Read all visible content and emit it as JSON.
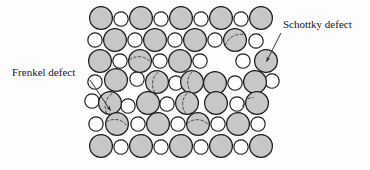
{
  "figure": {
    "background_color": "#fdfdfd",
    "anion": {
      "name": "large-ion",
      "fill": "#c7c7c7",
      "stroke": "#1c1c1c",
      "radius": 11.4
    },
    "cation": {
      "name": "small-ion",
      "fill": "#fefefe",
      "stroke": "#1c1c1c",
      "radius": 7.2
    },
    "defect_marker": {
      "stroke": "#4a4a52",
      "style": "dashed",
      "dash": "2.6,2.2"
    },
    "leader_stroke": "#2a2a30"
  },
  "labels": [
    {
      "id": "schottky",
      "text": "Schottky defect",
      "x": 283,
      "y": 28,
      "anchor": "start",
      "leader": {
        "x1": 281,
        "y1": 33,
        "x2": 266.5,
        "y2": 61.5
      }
    },
    {
      "id": "frenkel",
      "text": "Frenkel defect",
      "x": 12,
      "y": 76,
      "anchor": "start",
      "leader": {
        "x1": 90,
        "y1": 80,
        "x2": 110.5,
        "y2": 110.5
      }
    }
  ],
  "lattice": {
    "rows": 7,
    "description": "Alternating large and small ions; rows offset, with vacancies and displaced ions marking Schottky and Frenkel defects.",
    "atoms": [
      {
        "t": "L",
        "x": 101,
        "y": 18
      },
      {
        "t": "S",
        "x": 121,
        "y": 19
      },
      {
        "t": "L",
        "x": 141,
        "y": 18
      },
      {
        "t": "S",
        "x": 161,
        "y": 19
      },
      {
        "t": "L",
        "x": 181,
        "y": 18
      },
      {
        "t": "S",
        "x": 201,
        "y": 19
      },
      {
        "t": "L",
        "x": 221,
        "y": 18
      },
      {
        "t": "S",
        "x": 241,
        "y": 19
      },
      {
        "t": "L",
        "x": 261,
        "y": 18
      },
      {
        "t": "S",
        "x": 95,
        "y": 40
      },
      {
        "t": "L",
        "x": 115,
        "y": 40
      },
      {
        "t": "S",
        "x": 135,
        "y": 40
      },
      {
        "t": "L",
        "x": 155,
        "y": 40
      },
      {
        "t": "S",
        "x": 175,
        "y": 40
      },
      {
        "t": "L",
        "x": 195,
        "y": 40
      },
      {
        "t": "S",
        "x": 215,
        "y": 40
      },
      {
        "t": "L",
        "x": 235,
        "y": 40,
        "d": "arc"
      },
      {
        "t": "S",
        "x": 256,
        "y": 41
      },
      {
        "t": "L",
        "x": 100,
        "y": 61
      },
      {
        "t": "S",
        "x": 120,
        "y": 61
      },
      {
        "t": "L",
        "x": 140,
        "y": 61,
        "d": "arc"
      },
      {
        "t": "S",
        "x": 160,
        "y": 61
      },
      {
        "t": "L",
        "x": 180,
        "y": 61
      },
      {
        "t": "S",
        "x": 200,
        "y": 61
      },
      {
        "t": "S",
        "x": 243,
        "y": 61
      },
      {
        "t": "L",
        "x": 266,
        "y": 61
      },
      {
        "t": "S",
        "x": 95,
        "y": 82
      },
      {
        "t": "L",
        "x": 116,
        "y": 80
      },
      {
        "t": "S",
        "x": 137,
        "y": 79
      },
      {
        "t": "L",
        "x": 157,
        "y": 82,
        "d": "arc"
      },
      {
        "t": "S",
        "x": 176,
        "y": 83
      },
      {
        "t": "L",
        "x": 192,
        "y": 82,
        "d": "arc"
      },
      {
        "t": "L",
        "x": 215,
        "y": 83
      },
      {
        "t": "S",
        "x": 235,
        "y": 83
      },
      {
        "t": "L",
        "x": 255,
        "y": 82
      },
      {
        "t": "S",
        "x": 272,
        "y": 81
      },
      {
        "t": "S",
        "x": 92,
        "y": 101
      },
      {
        "t": "L",
        "x": 110,
        "y": 103,
        "d": "arc"
      },
      {
        "t": "S",
        "x": 128,
        "y": 106
      },
      {
        "t": "L",
        "x": 148,
        "y": 103
      },
      {
        "t": "S",
        "x": 167,
        "y": 104
      },
      {
        "t": "L",
        "x": 187,
        "y": 103,
        "d": "arc"
      },
      {
        "t": "L",
        "x": 216,
        "y": 103
      },
      {
        "t": "S",
        "x": 237,
        "y": 104
      },
      {
        "t": "L",
        "x": 257,
        "y": 103
      },
      {
        "t": "S",
        "x": 96,
        "y": 124
      },
      {
        "t": "L",
        "x": 117,
        "y": 124,
        "d": "arc"
      },
      {
        "t": "S",
        "x": 138,
        "y": 124
      },
      {
        "t": "L",
        "x": 158,
        "y": 124
      },
      {
        "t": "S",
        "x": 178,
        "y": 124
      },
      {
        "t": "L",
        "x": 198,
        "y": 124,
        "d": "arc"
      },
      {
        "t": "S",
        "x": 218,
        "y": 124
      },
      {
        "t": "L",
        "x": 238,
        "y": 124
      },
      {
        "t": "S",
        "x": 258,
        "y": 124
      },
      {
        "t": "L",
        "x": 101,
        "y": 146
      },
      {
        "t": "S",
        "x": 121,
        "y": 147
      },
      {
        "t": "L",
        "x": 141,
        "y": 146
      },
      {
        "t": "S",
        "x": 161,
        "y": 147
      },
      {
        "t": "L",
        "x": 181,
        "y": 146
      },
      {
        "t": "S",
        "x": 201,
        "y": 147
      },
      {
        "t": "L",
        "x": 221,
        "y": 146
      },
      {
        "t": "S",
        "x": 241,
        "y": 147
      },
      {
        "t": "L",
        "x": 261,
        "y": 146
      }
    ],
    "defect_arcs": [
      {
        "cx": 235,
        "cy": 40,
        "r": 11.4,
        "rot": -28
      },
      {
        "cx": 140,
        "cy": 61,
        "r": 11.4,
        "rot": 6
      },
      {
        "cx": 157,
        "cy": 82,
        "r": 11.4,
        "rot": -78
      },
      {
        "cx": 192,
        "cy": 82,
        "r": 11.4,
        "rot": -86
      },
      {
        "cx": 110,
        "cy": 103,
        "r": 11.4,
        "rot": -72
      },
      {
        "cx": 187,
        "cy": 103,
        "r": 11.4,
        "rot": -84
      },
      {
        "cx": 117,
        "cy": 124,
        "r": 11.4,
        "rot": 12
      },
      {
        "cx": 198,
        "cy": 124,
        "r": 11.4,
        "rot": 4
      },
      {
        "cx": 248,
        "cy": 102,
        "r": 7.2,
        "rot": -40
      }
    ]
  }
}
